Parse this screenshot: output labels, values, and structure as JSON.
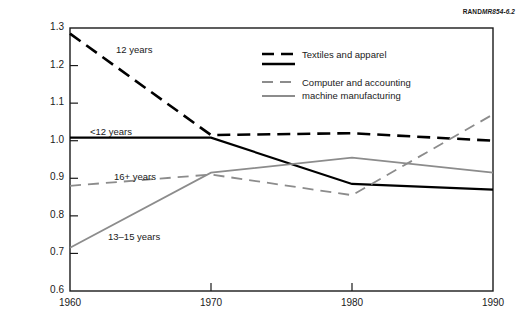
{
  "source_note": {
    "brand": "RAND",
    "ref": "MR854-6.2"
  },
  "chart_data": {
    "type": "line",
    "title": "",
    "subtitle": "",
    "xlabel": "",
    "ylabel": "Ratio of California immigrant earnings to native earnings in rest of U.S.",
    "x": [
      1960,
      1970,
      1980,
      1990
    ],
    "xticklabels": [
      "1960",
      "1970",
      "1980",
      "1990"
    ],
    "xlim": [
      1960,
      1990
    ],
    "ylim": [
      0.6,
      1.3
    ],
    "yticks": [
      0.6,
      0.7,
      0.8,
      0.9,
      1.0,
      1.1,
      1.2,
      1.3
    ],
    "yticklabels": [
      "0.6",
      "0.7",
      "0.8",
      "0.9",
      "1.0",
      "1.1",
      "1.2",
      "1.3"
    ],
    "grid": false,
    "legend_position": "upper-center-right",
    "series": [
      {
        "name": "12 years",
        "group": "Textiles and apparel",
        "style": "dashed",
        "color": "#000000",
        "width": 2.6,
        "values": [
          1.285,
          1.015,
          1.02,
          1.0
        ]
      },
      {
        "name": "<12 years",
        "group": "Textiles and apparel",
        "style": "solid",
        "color": "#000000",
        "width": 2.2,
        "values": [
          1.008,
          1.008,
          0.885,
          0.87
        ]
      },
      {
        "name": "16+ years",
        "group": "Computer and accounting machine manufacturing",
        "style": "dashed",
        "color": "#8c8c8c",
        "width": 1.8,
        "values": [
          0.88,
          0.91,
          0.855,
          1.07
        ]
      },
      {
        "name": "13–15 years",
        "group": "Computer and accounting machine manufacturing",
        "style": "solid",
        "color": "#8c8c8c",
        "width": 1.8,
        "values": [
          0.715,
          0.915,
          0.955,
          0.915
        ]
      }
    ],
    "annotations": [
      {
        "text": "12 years",
        "x": 1960,
        "y": 1.3,
        "px": 116,
        "py": 44
      },
      {
        "text": "<12 years",
        "x": 1960,
        "y": 1.03,
        "px": 90,
        "py": 126
      },
      {
        "text": "16+ years",
        "x": 1960,
        "y": 0.92,
        "px": 114,
        "py": 171
      },
      {
        "text": "13–15 years",
        "x": 1960,
        "y": 0.76,
        "px": 108,
        "py": 231
      }
    ]
  },
  "legend": {
    "entries": [
      {
        "label": "Textiles and apparel",
        "swatches": [
          {
            "style": "dashed",
            "color": "#000000",
            "width": 2.6
          },
          {
            "style": "solid",
            "color": "#000000",
            "width": 2.4
          }
        ]
      },
      {
        "label": "Computer and accounting",
        "label2": "machine manufacturing",
        "swatches": [
          {
            "style": "dashed",
            "color": "#8c8c8c",
            "width": 1.8
          },
          {
            "style": "solid",
            "color": "#8c8c8c",
            "width": 1.8
          }
        ]
      }
    ]
  },
  "colors": {
    "black_series": "#000000",
    "gray_series": "#8c8c8c",
    "frame": "#1a1a1a",
    "background": "#ffffff"
  }
}
